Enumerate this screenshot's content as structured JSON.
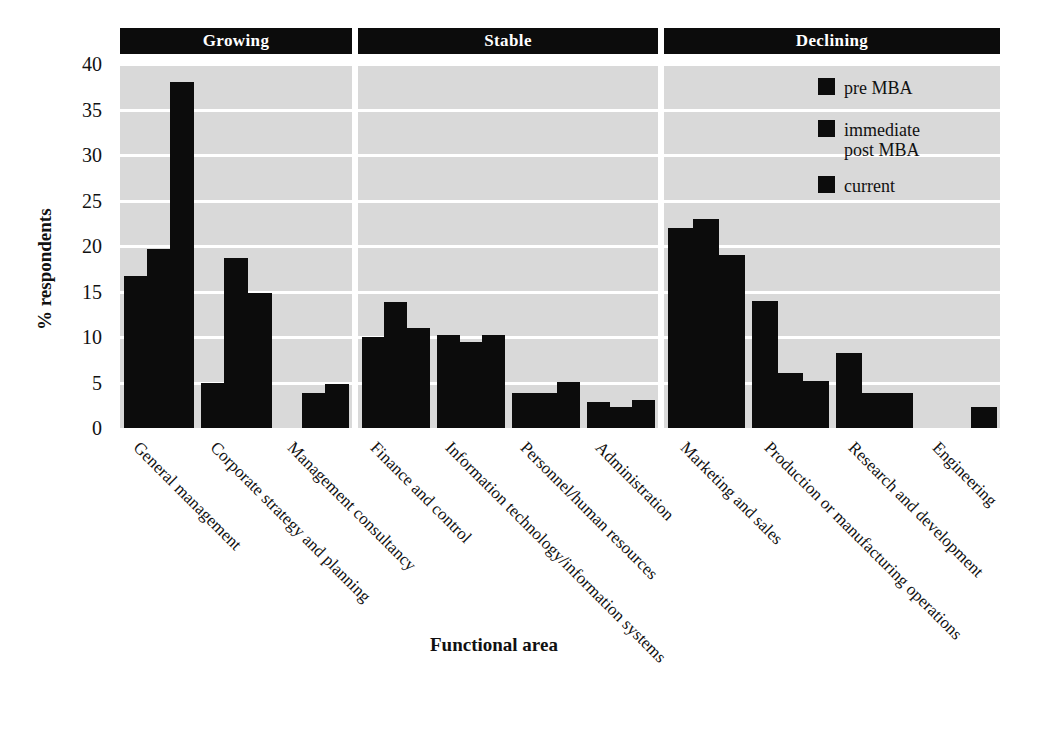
{
  "chart_data": {
    "type": "bar",
    "title": "",
    "xlabel": "Functional area",
    "ylabel": "% respondents",
    "ylim": [
      0,
      40
    ],
    "yticks": [
      0,
      5,
      10,
      15,
      20,
      25,
      30,
      35,
      40
    ],
    "grid": true,
    "legend_position": "top-right",
    "series": [
      {
        "name": "pre MBA",
        "values": [
          16.7,
          5.0,
          0.0,
          10.0,
          10.2,
          3.9,
          2.9,
          22.0,
          14.0,
          8.2,
          0.0
        ]
      },
      {
        "name": "immediate\npost MBA",
        "values": [
          19.7,
          18.7,
          3.9,
          13.8,
          9.5,
          3.9,
          2.3,
          23.0,
          6.0,
          3.9,
          0.0
        ]
      },
      {
        "name": "current",
        "values": [
          38.0,
          14.8,
          4.8,
          11.0,
          10.2,
          5.1,
          3.1,
          19.0,
          5.2,
          3.9,
          2.3
        ]
      }
    ],
    "categories": [
      "General management",
      "Corporate strategy and planning",
      "Management consultancy",
      "Finance and control",
      "Information technology/information systems",
      "Personnel/human resources",
      "Administration",
      "Marketing and sales",
      "Production or manufacturing operations",
      "Research and development",
      "Engineering"
    ],
    "groups": [
      {
        "label": "Growing",
        "categories": [
          0,
          1,
          2
        ]
      },
      {
        "label": "Stable",
        "categories": [
          3,
          4,
          5,
          6
        ]
      },
      {
        "label": "Declining",
        "categories": [
          7,
          8,
          9,
          10
        ]
      }
    ],
    "colors": {
      "bar": "#0c0c0c",
      "panel_background": "#d9d9d9",
      "gridline": "#ffffff",
      "band_background": "#0c0c0c",
      "band_text": "#ffffff",
      "page_background": "#ffffff"
    }
  },
  "legend": {
    "items": [
      {
        "label": "pre MBA"
      },
      {
        "label": "immediate\npost MBA"
      },
      {
        "label": "current"
      }
    ]
  },
  "axes": {
    "y_title": "% respondents",
    "x_title": "Functional area"
  }
}
